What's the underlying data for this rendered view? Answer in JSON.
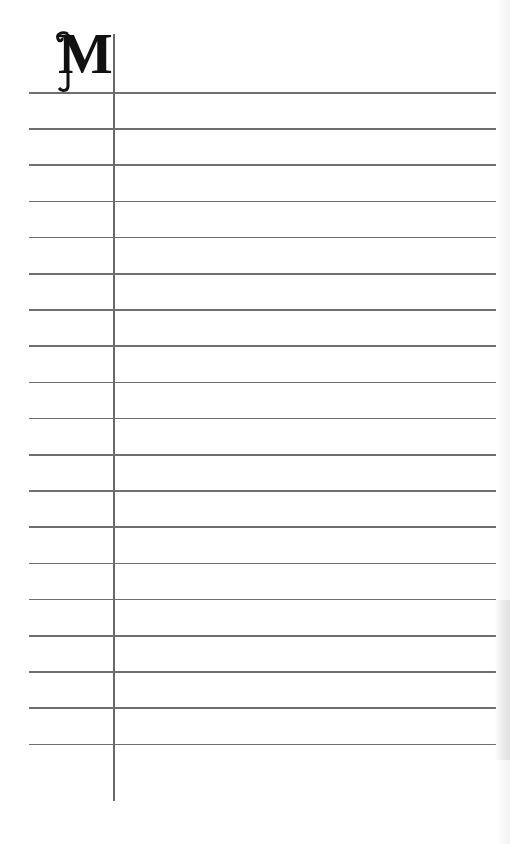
{
  "page": {
    "section_letter": "M",
    "ruled_line_count": 19,
    "colors": {
      "paper": "#ffffff",
      "rule": "#6f6f6f",
      "letter": "#111111"
    }
  }
}
